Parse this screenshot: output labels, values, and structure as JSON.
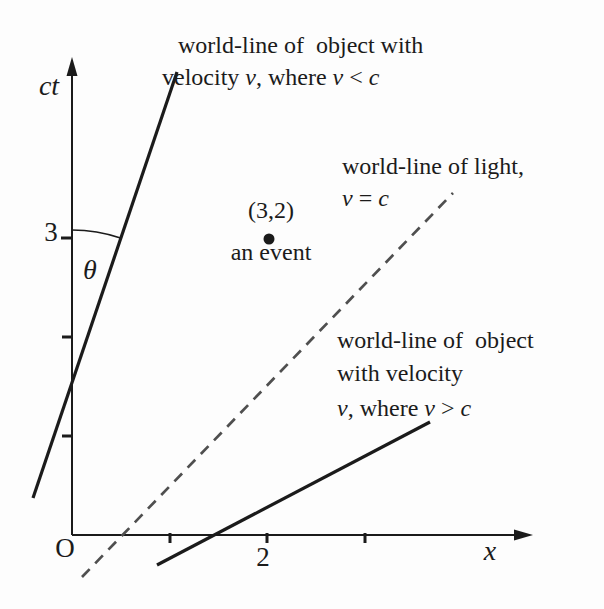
{
  "figure": {
    "background": "#fdfdfd",
    "ink_color": "#1b1b1b",
    "dashed_color": "#4f4f4f",
    "axes": {
      "ct_label": "ct",
      "x_label": "x",
      "origin_label": "O",
      "ct_tick_3_label": "3",
      "x_tick_2_label": "2"
    },
    "angle": {
      "label": "θ"
    },
    "event": {
      "coords_label": "(3,2)",
      "caption": "an event",
      "x": 2,
      "ct": 3
    },
    "annotations": {
      "slow": {
        "line1_parts": [
          {
            "t": "world-line of  object with",
            "i": false
          }
        ],
        "line2_parts": [
          {
            "t": "velocity ",
            "i": false
          },
          {
            "t": "v",
            "i": true
          },
          {
            "t": ", where ",
            "i": false
          },
          {
            "t": "v",
            "i": true
          },
          {
            "t": " < ",
            "i": false
          },
          {
            "t": "c",
            "i": true
          }
        ]
      },
      "light": {
        "line1_parts": [
          {
            "t": "world-line of light,",
            "i": false
          }
        ],
        "line2_parts": [
          {
            "t": "v",
            "i": true
          },
          {
            "t": " = ",
            "i": false
          },
          {
            "t": "c",
            "i": true
          }
        ]
      },
      "fast": {
        "line1_parts": [
          {
            "t": "world-line of  object",
            "i": false
          }
        ],
        "line2_parts": [
          {
            "t": "with velocity",
            "i": false
          }
        ],
        "line3_parts": [
          {
            "t": "v",
            "i": true
          },
          {
            "t": ", where ",
            "i": false
          },
          {
            "t": "v",
            "i": true
          },
          {
            "t": " > ",
            "i": false
          },
          {
            "t": "c",
            "i": true
          }
        ]
      }
    }
  }
}
